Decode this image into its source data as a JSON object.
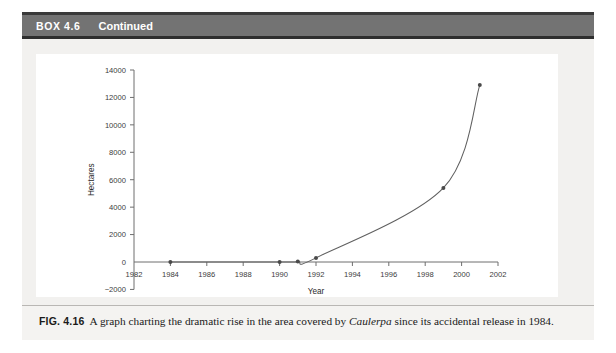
{
  "box": {
    "label": "BOX 4.6",
    "continued": "Continued"
  },
  "caption": {
    "figure_number": "FIG. 4.16",
    "text_before_italic": "A graph charting the dramatic rise in the area covered by ",
    "italic_term": "Caulerpa",
    "text_after_italic": " since its accidental release in 1984."
  },
  "colors": {
    "header_bar": "#737373",
    "header_rule": "#2e2e2e",
    "box_background": "#f2f1ef",
    "panel_background": "#ffffff",
    "axis": "#6e6e6e",
    "curve": "#606060",
    "point": "#4a4a4a"
  },
  "chart_data": {
    "type": "line",
    "title": "",
    "xlabel": "Year",
    "ylabel": "Hectares",
    "xlim": [
      1982,
      2002
    ],
    "ylim": [
      -2000,
      14000
    ],
    "xticks": [
      1982,
      1984,
      1986,
      1988,
      1990,
      1992,
      1994,
      1996,
      1998,
      2000,
      2002
    ],
    "xtick_labels": [
      "1982",
      "1984",
      "1986",
      "1988",
      "1990",
      "1992",
      "1994",
      "1996",
      "1998",
      "2000",
      "2002"
    ],
    "yticks": [
      -2000,
      0,
      2000,
      4000,
      6000,
      8000,
      10000,
      12000,
      14000
    ],
    "ytick_labels": [
      "−2000",
      "0",
      "2000",
      "4000",
      "6000",
      "8000",
      "10000",
      "12000",
      "14000"
    ],
    "grid": false,
    "legend": null,
    "series": [
      {
        "name": "Area covered by Caulerpa",
        "marker": "circle",
        "x": [
          1984,
          1990,
          1991,
          1992,
          1999,
          2001
        ],
        "values": [
          1,
          3,
          30,
          300,
          5400,
          12900
        ]
      }
    ]
  }
}
